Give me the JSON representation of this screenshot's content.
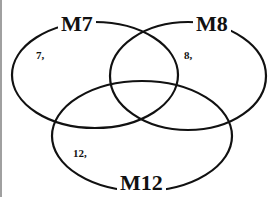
{
  "diagram": {
    "type": "venn",
    "sets": [
      {
        "id": "m7",
        "label": "M7",
        "region_label": "7,"
      },
      {
        "id": "m8",
        "label": "M8",
        "region_label": "8,"
      },
      {
        "id": "m12",
        "label": "M12",
        "region_label": "12,"
      }
    ],
    "colors": {
      "stroke": "#111111",
      "background": "#ffffff",
      "frame": "#a0a0a0"
    }
  }
}
